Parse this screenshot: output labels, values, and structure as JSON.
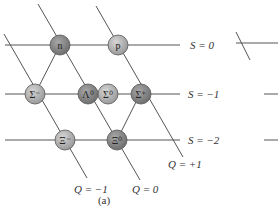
{
  "figure_label": "(a)",
  "strangeness_labels": [
    "S = 0",
    "S = −1",
    "S = −2"
  ],
  "charge_labels": [
    "Q = −1",
    "Q = 0",
    "Q = +1"
  ],
  "particles": [
    {
      "id": "n",
      "label": "n",
      "S": 0,
      "Q": 0,
      "shade": "dark"
    },
    {
      "id": "p",
      "label": "p",
      "S": 0,
      "Q": 1,
      "shade": "light"
    },
    {
      "id": "sigma-minus",
      "label": "Σ⁻",
      "S": -1,
      "Q": -1,
      "shade": "light"
    },
    {
      "id": "lambda0",
      "label": "Λ⁰",
      "S": -1,
      "Q": 0,
      "shade": "dark"
    },
    {
      "id": "sigma0",
      "label": "Σ⁰",
      "S": -1,
      "Q": 0,
      "shade": "light"
    },
    {
      "id": "sigma-plus",
      "label": "Σ⁺",
      "S": -1,
      "Q": 1,
      "shade": "dark"
    },
    {
      "id": "xi-minus",
      "label": "Ξ⁻",
      "S": -2,
      "Q": -1,
      "shade": "light"
    },
    {
      "id": "xi0",
      "label": "Ξ⁰",
      "S": -2,
      "Q": 0,
      "shade": "dark"
    }
  ],
  "colors": {
    "dark": "#8a8a8a",
    "light": "#b8b8b8",
    "line": "#555555"
  }
}
